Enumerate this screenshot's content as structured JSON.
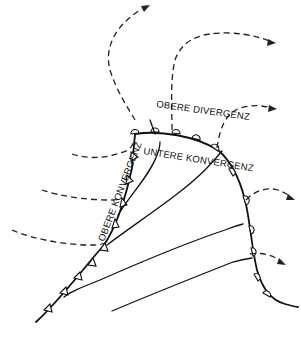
{
  "diagram": {
    "type": "airflow schematic (upper-level divergence / convergence over a frontal bulge)",
    "labels": {
      "upper_divergence": "OBERE DIVERGENZ",
      "lower_convergence": "UNTERE KONVERGENZ",
      "upper_convergence": "OBERE KONVERGENZ"
    },
    "legend_semantics": {
      "solid_lines": "low-level flow (converging toward the front)",
      "dashed_arrows": "upper-level flow (diverging outward)",
      "triangles": "cold-front symbols",
      "semicircles": "warm-front symbols"
    },
    "colors": {
      "ink": "#111111",
      "background": "#ffffff"
    }
  }
}
